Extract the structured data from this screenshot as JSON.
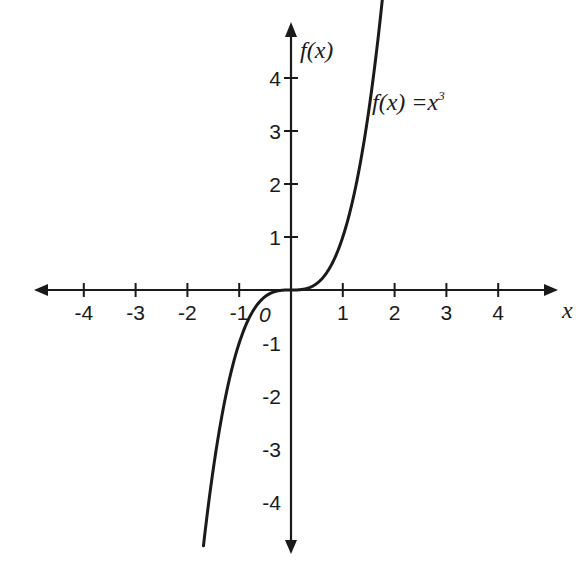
{
  "chart_data": {
    "type": "line",
    "title": "",
    "function": "f(x) = x^3",
    "xlabel": "x",
    "ylabel": "f(x)",
    "xlim": [
      -4.9,
      4.9
    ],
    "ylim": [
      -5.0,
      5.5
    ],
    "grid": false,
    "legend": "none",
    "annotation": {
      "text": "f(x) =x",
      "superscript": "3",
      "x": 1.55,
      "y": 4.4
    },
    "origin_label": "0",
    "x_ticks": [
      {
        "value": -4,
        "label": "-4"
      },
      {
        "value": -3,
        "label": "-3"
      },
      {
        "value": -2,
        "label": "-2"
      },
      {
        "value": -1,
        "label": "-1"
      },
      {
        "value": 1,
        "label": "1"
      },
      {
        "value": 2,
        "label": "2"
      },
      {
        "value": 3,
        "label": "3"
      },
      {
        "value": 4,
        "label": "4"
      }
    ],
    "y_ticks": [
      {
        "value": 4,
        "label": "4"
      },
      {
        "value": 3,
        "label": "3"
      },
      {
        "value": 2,
        "label": "2"
      },
      {
        "value": 1,
        "label": "1"
      },
      {
        "value": -1,
        "label": "-1"
      },
      {
        "value": -2,
        "label": "-2"
      },
      {
        "value": -3,
        "label": "-3"
      },
      {
        "value": -4,
        "label": "-4"
      }
    ],
    "series": [
      {
        "name": "f(x) = x^3",
        "color": "#1a1a1a",
        "x": [
          -1.69,
          -1.5,
          -1.25,
          -1.0,
          -0.75,
          -0.5,
          -0.25,
          0,
          0.25,
          0.5,
          0.75,
          1.0,
          1.25,
          1.5,
          1.77
        ],
        "y": [
          -4.83,
          -3.375,
          -1.953,
          -1.0,
          -0.422,
          -0.125,
          -0.016,
          0,
          0.016,
          0.125,
          0.422,
          1.0,
          1.953,
          3.375,
          5.55
        ]
      }
    ]
  },
  "labels": {
    "x_axis": "x",
    "y_axis": "f(x)",
    "curve_prefix": "f(x) =x",
    "curve_exponent": "3",
    "origin": "0"
  },
  "colors": {
    "ink": "#1a1a1a",
    "background": "#ffffff"
  }
}
